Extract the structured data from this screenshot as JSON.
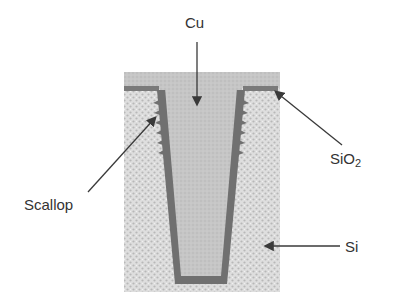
{
  "figure": {
    "labels": {
      "cu": "Cu",
      "scallop": "Scallop",
      "sio2_main": "SiO",
      "sio2_sub": "2",
      "si": "Si"
    },
    "colors": {
      "silicon": "#d8d8d8",
      "copper_fill": "#c4c4c4",
      "liner": "#6e6e6e",
      "oxide": "#7a7a7a",
      "arrow": "#3a3a3a",
      "text": "#333333"
    }
  }
}
